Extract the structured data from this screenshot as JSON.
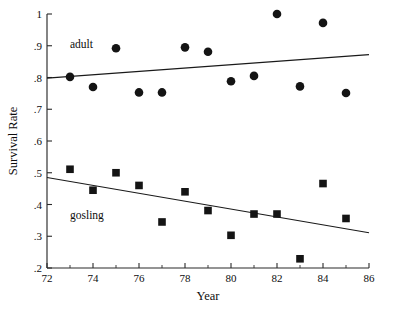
{
  "chart_data": {
    "type": "scatter",
    "title": "",
    "xlabel": "Year",
    "ylabel": "Survival Rate",
    "xlim": [
      72,
      86
    ],
    "ylim": [
      0.2,
      1.0
    ],
    "grid": false,
    "legend_position": "inline-annotation",
    "x_ticks": [
      72,
      74,
      76,
      78,
      80,
      82,
      84,
      86
    ],
    "x_tick_labels": [
      "72",
      "74",
      "76",
      "78",
      "80",
      "82",
      "84",
      "86"
    ],
    "x_minor_ticks": [
      73,
      75,
      77,
      79,
      81,
      83,
      85
    ],
    "y_ticks": [
      0.2,
      0.3,
      0.4,
      0.5,
      0.6,
      0.7,
      0.8,
      0.9,
      1.0
    ],
    "y_tick_labels": [
      ".2",
      ".3",
      ".4",
      ".5",
      ".6",
      ".7",
      ".8",
      ".9",
      "1"
    ],
    "x": [
      73,
      74,
      75,
      76,
      77,
      78,
      79,
      80,
      81,
      82,
      83,
      84,
      85
    ],
    "series": [
      {
        "name": "adult",
        "marker": "circle",
        "color": "#141414",
        "values": [
          0.802,
          0.77,
          0.892,
          0.753,
          0.753,
          0.895,
          0.881,
          0.788,
          0.805,
          1.0,
          0.772,
          0.972,
          0.751
        ],
        "annotation": "adult",
        "annotation_x": 73.0,
        "annotation_y": 0.905,
        "trendline": {
          "x_start": 72,
          "y_start": 0.798,
          "x_end": 86,
          "y_end": 0.872
        }
      },
      {
        "name": "gosling",
        "marker": "square",
        "color": "#141414",
        "values": [
          0.511,
          0.445,
          0.5,
          0.46,
          0.345,
          0.44,
          0.381,
          0.303,
          0.37,
          0.37,
          0.229,
          0.466,
          0.356
        ],
        "annotation": "gosling",
        "annotation_x": 73.0,
        "annotation_y": 0.368,
        "trendline": {
          "x_start": 72,
          "y_start": 0.485,
          "x_end": 86,
          "y_end": 0.311
        }
      }
    ]
  }
}
